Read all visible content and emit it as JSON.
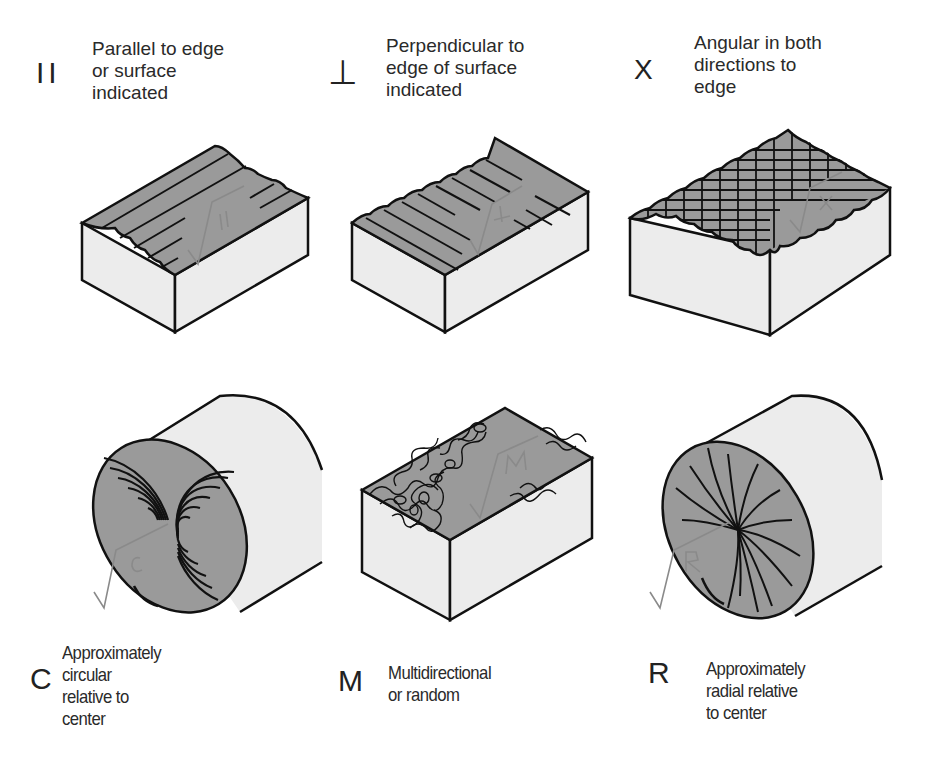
{
  "items": [
    {
      "symbol": "II",
      "symbol_name": "parallel-symbol",
      "description": "Parallel to edge\nor surface\nindicated",
      "pattern": "parallel",
      "annotation": "II"
    },
    {
      "symbol": "⊥",
      "symbol_name": "perpendicular-symbol",
      "description": "Perpendicular to\nedge of surface\nindicated",
      "pattern": "perpendicular",
      "annotation": "⊥"
    },
    {
      "symbol": "X",
      "symbol_name": "angular-symbol",
      "description": "Angular in both\ndirections to\nedge",
      "pattern": "crosshatch",
      "annotation": "X"
    },
    {
      "symbol": "C",
      "symbol_name": "circular-symbol",
      "description": "Approximately\ncircular\nrelative to\ncenter",
      "pattern": "circular",
      "annotation": "C"
    },
    {
      "symbol": "M",
      "symbol_name": "multidirectional-symbol",
      "description": "Multidirectional\nor random",
      "pattern": "random",
      "annotation": "M"
    },
    {
      "symbol": "R",
      "symbol_name": "radial-symbol",
      "description": "Approximately\nradial relative\nto center",
      "pattern": "radial",
      "annotation": "R"
    }
  ],
  "colors": {
    "surface_dark": "#9a9a9a",
    "surface_light": "#ececec",
    "outline": "#111111",
    "annotation": "#8a8a8a"
  }
}
